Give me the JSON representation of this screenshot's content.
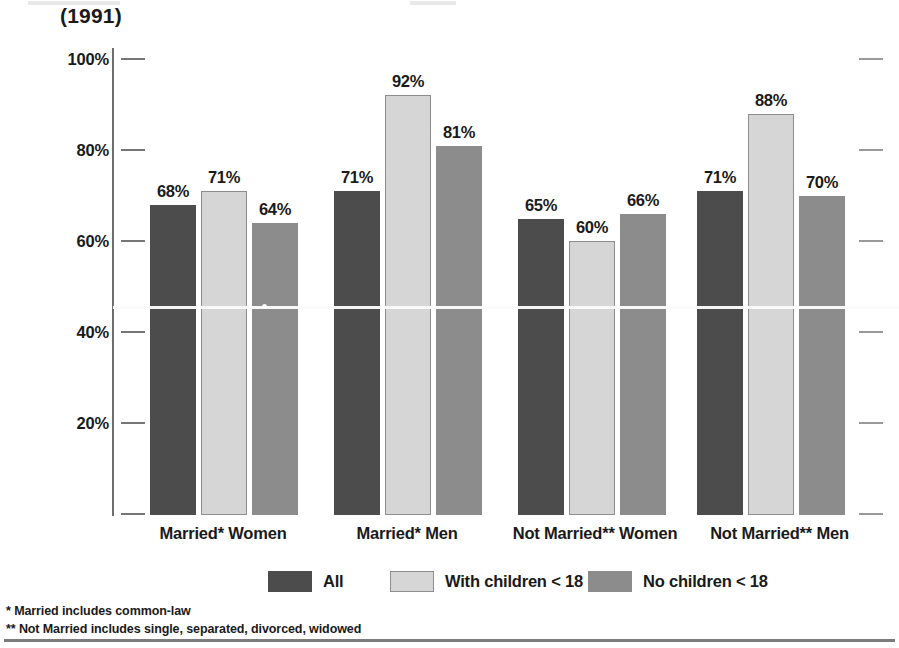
{
  "chart_data": {
    "type": "bar",
    "title": "(1991)",
    "xlabel": "",
    "ylabel": "",
    "ylim": [
      0,
      100
    ],
    "ytick_labels": [
      "100%",
      "80%",
      "60%",
      "40%",
      "20%",
      ""
    ],
    "ytick_values": [
      100,
      80,
      60,
      40,
      20,
      0
    ],
    "grid": false,
    "legend_position": "bottom",
    "categories": [
      "Married* Women",
      "Married* Men",
      "Not Married** Women",
      "Not Married** Men"
    ],
    "series": [
      {
        "name": "All",
        "color": "#4c4c4c",
        "values": [
          68,
          71,
          65,
          71
        ],
        "labels": [
          "68%",
          "71%",
          "65%",
          "71%"
        ]
      },
      {
        "name": "With children < 18",
        "color": "#d6d6d6",
        "values": [
          71,
          92,
          60,
          88
        ],
        "labels": [
          "71%",
          "92%",
          "60%",
          "88%"
        ]
      },
      {
        "name": "No children < 18",
        "color": "#8c8c8c",
        "values": [
          64,
          81,
          66,
          70
        ],
        "labels": [
          "64%",
          "81%",
          "66%",
          "70%"
        ]
      }
    ],
    "annotations": [
      "* Married includes common-law",
      "** Not Married includes single, separated, divorced, widowed"
    ]
  },
  "title": "(1991)",
  "axis": {
    "ticks": [
      {
        "label": "100%",
        "value": 100
      },
      {
        "label": "80%",
        "value": 80
      },
      {
        "label": "60%",
        "value": 60
      },
      {
        "label": "40%",
        "value": 40
      },
      {
        "label": "20%",
        "value": 20
      },
      {
        "label": "",
        "value": 0
      }
    ]
  },
  "legend": {
    "items": [
      {
        "label": "All",
        "swatch": "all"
      },
      {
        "label": "With children < 18",
        "swatch": "with"
      },
      {
        "label": "No children < 18",
        "swatch": "no"
      }
    ]
  },
  "footnotes": [
    "* Married includes common-law",
    "** Not Married includes single, separated, divorced, widowed"
  ]
}
